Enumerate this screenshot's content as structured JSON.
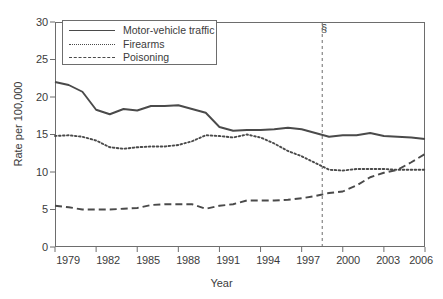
{
  "chart_data": {
    "type": "line",
    "title": "",
    "xlabel": "Year",
    "ylabel": "Rate per 100,000",
    "xlim": [
      1979,
      2006
    ],
    "ylim": [
      0,
      30
    ],
    "grid": false,
    "legend_position": "top-left",
    "x": [
      1979,
      1980,
      1981,
      1982,
      1983,
      1984,
      1985,
      1986,
      1987,
      1988,
      1989,
      1990,
      1991,
      1992,
      1993,
      1994,
      1995,
      1996,
      1997,
      1998,
      1999,
      2000,
      2001,
      2002,
      2003,
      2004,
      2005,
      2006
    ],
    "xticks": [
      "1979",
      "1982",
      "1985",
      "1988",
      "1991",
      "1994",
      "1997",
      "2000",
      "2003",
      "2006"
    ],
    "yticks": [
      "0",
      "5",
      "10",
      "15",
      "20",
      "25",
      "30"
    ],
    "series": [
      {
        "name": "Motor-vehicle traffic",
        "style": "solid",
        "color": "#4a4a4a",
        "values": [
          22.0,
          21.6,
          20.7,
          18.3,
          17.7,
          18.4,
          18.2,
          18.8,
          18.8,
          18.9,
          18.4,
          17.9,
          16.0,
          15.5,
          15.6,
          15.6,
          15.7,
          15.9,
          15.7,
          15.2,
          14.7,
          14.9,
          14.9,
          15.2,
          14.8,
          14.7,
          14.6,
          14.4
        ]
      },
      {
        "name": "Firearms",
        "style": "dotted",
        "color": "#4a4a4a",
        "values": [
          14.8,
          14.9,
          14.7,
          14.2,
          13.3,
          13.1,
          13.3,
          13.4,
          13.4,
          13.6,
          14.1,
          14.9,
          14.8,
          14.6,
          15.0,
          14.6,
          13.8,
          12.8,
          12.1,
          11.2,
          10.3,
          10.2,
          10.4,
          10.4,
          10.4,
          10.3,
          10.3,
          10.3
        ]
      },
      {
        "name": "Poisoning",
        "style": "dashed",
        "color": "#4a4a4a",
        "values": [
          5.5,
          5.3,
          5.0,
          5.0,
          5.0,
          5.1,
          5.2,
          5.6,
          5.7,
          5.7,
          5.7,
          5.1,
          5.5,
          5.7,
          6.2,
          6.2,
          6.2,
          6.3,
          6.5,
          6.8,
          7.2,
          7.4,
          8.2,
          9.3,
          9.9,
          10.3,
          11.3,
          12.4
        ]
      }
    ],
    "reference_line": {
      "x": 1998.5,
      "style": "dashed",
      "marker": "§"
    }
  }
}
